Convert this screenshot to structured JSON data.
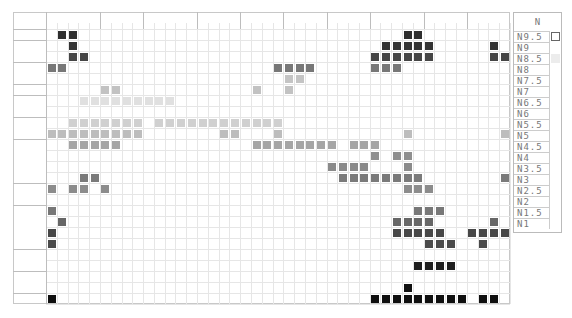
{
  "chart_data": {
    "type": "heatmap",
    "title": "",
    "hue_groups": [
      {
        "name": "R",
        "ticks": [
          "2.5",
          "5",
          "6",
          "7.5",
          "10"
        ]
      },
      {
        "name": "YR",
        "ticks": [
          "2.5",
          "5",
          "7.5",
          "10"
        ]
      },
      {
        "name": "Y",
        "ticks": [
          "1",
          "2.5",
          "5",
          "7.5",
          "10"
        ]
      },
      {
        "name": "GY",
        "ticks": [
          "2.5",
          "5",
          "7.5",
          "10"
        ]
      },
      {
        "name": "G",
        "ticks": [
          "2.5",
          "5",
          "7.5",
          "10"
        ]
      },
      {
        "name": "BG",
        "ticks": [
          "2.5",
          "5",
          "7.5",
          "10"
        ]
      },
      {
        "name": "B",
        "ticks": [
          "2.5",
          "5",
          "7.5",
          "10"
        ]
      },
      {
        "name": "PB",
        "ticks": [
          "2.5",
          "5",
          "6",
          "7.5",
          "10"
        ]
      },
      {
        "name": "P",
        "ticks": [
          "2.5",
          "5",
          "7.5",
          "10"
        ]
      },
      {
        "name": "RP",
        "ticks": [
          "2.5",
          "5",
          "7.5",
          "10"
        ]
      }
    ],
    "rows": [
      {
        "label": "V",
        "color": "#2e2e2e",
        "cols": [
          1,
          2,
          33,
          34
        ]
      },
      {
        "label": "S2",
        "color": "#333333",
        "cols": [
          2,
          31,
          32,
          33,
          34,
          35,
          41
        ]
      },
      {
        "label": "S1",
        "color": "#454545",
        "cols": [
          2,
          3,
          30,
          31,
          32,
          33,
          34,
          35,
          41,
          42
        ]
      },
      {
        "label": "B2",
        "color": "#777777",
        "cols": [
          0,
          1,
          21,
          22,
          23,
          24,
          30,
          31,
          32
        ]
      },
      {
        "label": "B1",
        "color": "#c4c4c4",
        "cols": [
          22,
          23
        ]
      },
      {
        "label": "P",
        "color": "#c2c2c2",
        "cols": [
          5,
          6,
          19,
          22
        ]
      },
      {
        "label": "Vp2",
        "color": "#e0e0e0",
        "cols": [
          3,
          4,
          5,
          6,
          7,
          8,
          9,
          10,
          11
        ]
      },
      {
        "label": "Vp1",
        "color": "#e8e8e8",
        "cols": []
      },
      {
        "label": "Lgr1",
        "color": "#d0d0d0",
        "cols": [
          2,
          3,
          4,
          5,
          6,
          7,
          8,
          10,
          11,
          12,
          13,
          14,
          15,
          16,
          17,
          18,
          19,
          20,
          21
        ]
      },
      {
        "label": "Lgr2",
        "color": "#bdbdbd",
        "cols": [
          0,
          1,
          2,
          3,
          4,
          5,
          6,
          7,
          8,
          16,
          17,
          21,
          33,
          42
        ]
      },
      {
        "label": "L1",
        "color": "#a5a5a5",
        "cols": [
          2,
          3,
          4,
          5,
          6,
          19,
          20,
          21,
          22,
          23,
          24,
          25,
          26,
          28,
          29,
          30
        ]
      },
      {
        "label": "L3",
        "color": "#8f8f8f",
        "cols": [
          30,
          32,
          33
        ]
      },
      {
        "label": "L2",
        "color": "#8a8a8a",
        "cols": [
          26,
          27,
          28,
          29,
          33
        ]
      },
      {
        "label": "L4",
        "color": "#7a7a7a",
        "cols": [
          3,
          4,
          27,
          28,
          29,
          30,
          31,
          32,
          33,
          34,
          42
        ]
      },
      {
        "label": "Gr1",
        "color": "#8c8c8c",
        "cols": [
          0,
          2,
          3,
          5,
          33,
          34,
          35
        ]
      },
      {
        "label": "Gr2",
        "color": "#999999",
        "cols": []
      },
      {
        "label": "D11",
        "color": "#777777",
        "cols": [
          0,
          34,
          35,
          36
        ]
      },
      {
        "label": "D13",
        "color": "#666666",
        "cols": [
          1,
          32,
          33,
          34,
          35,
          41
        ]
      },
      {
        "label": "D14",
        "color": "#474747",
        "cols": [
          0,
          32,
          33,
          34,
          35,
          36,
          39,
          40,
          41,
          42
        ]
      },
      {
        "label": "D12",
        "color": "#4a4a4a",
        "cols": [
          0,
          35,
          36,
          37,
          40
        ]
      },
      {
        "label": "Dp2",
        "color": "#222222",
        "cols": []
      },
      {
        "label": "Dp1",
        "color": "#1e1e1e",
        "cols": [
          34,
          35,
          36,
          37
        ]
      },
      {
        "label": "Dk2",
        "color": "#111111",
        "cols": []
      },
      {
        "label": "Dk1",
        "color": "#111111",
        "cols": [
          33
        ]
      },
      {
        "label": "Dgr",
        "color": "#0f0f0f",
        "cols": [
          0,
          30,
          31,
          32,
          33,
          34,
          35,
          36,
          37,
          38,
          40,
          41
        ]
      }
    ],
    "group_breaks_after": [
      "V",
      "S1",
      "B1",
      "P",
      "Vp1",
      "Lgr2",
      "L4",
      "Gr2",
      "D12",
      "Dp1",
      "Dk1"
    ],
    "neutral_panel": {
      "title": "N",
      "items": [
        {
          "label": "N9.5",
          "swatch": "#ffffff",
          "swatch_border": true
        },
        {
          "label": "N9"
        },
        {
          "label": "N8.5",
          "swatch": "#ececec"
        },
        {
          "label": "N8"
        },
        {
          "label": "N7.5"
        },
        {
          "label": "N7"
        },
        {
          "label": "N6.5"
        },
        {
          "label": "N6"
        },
        {
          "label": "N5.5"
        },
        {
          "label": "N5"
        },
        {
          "label": "N4.5"
        },
        {
          "label": "N4"
        },
        {
          "label": "N3.5"
        },
        {
          "label": "N3"
        },
        {
          "label": "N2.5"
        },
        {
          "label": "N2"
        },
        {
          "label": "N1.5"
        },
        {
          "label": "N1"
        }
      ]
    },
    "xlabel": "",
    "ylabel": "",
    "grid": true,
    "legend": "none"
  }
}
